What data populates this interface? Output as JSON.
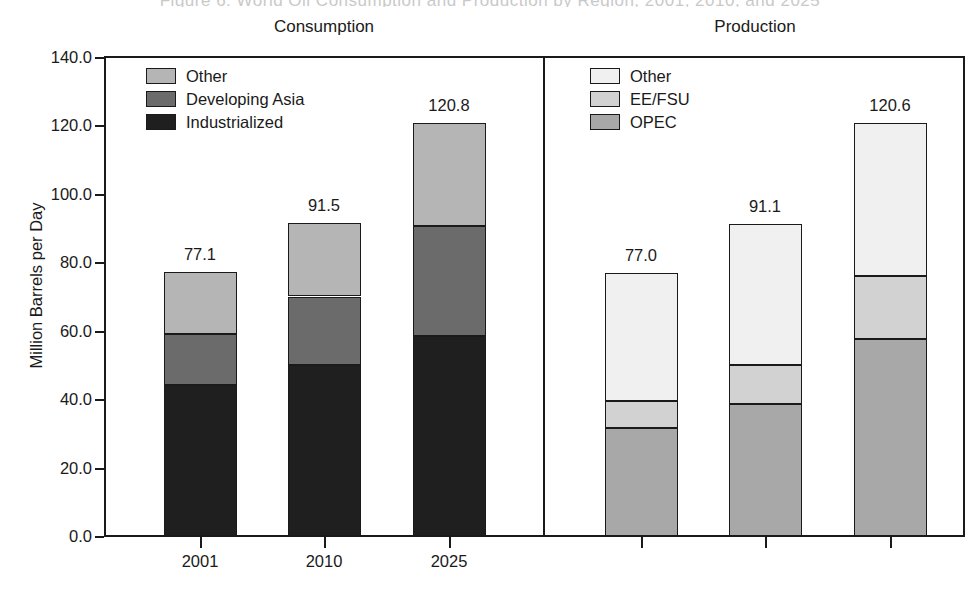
{
  "figure": {
    "ghost_title": "Figure 6.  World Oil Consumption and Production by Region, 2001, 2010, and 2025",
    "y_axis_label": "Million Barrels per Day",
    "y_ticks": [
      "0.0",
      "20.0",
      "40.0",
      "60.0",
      "80.0",
      "100.0",
      "120.0",
      "140.0"
    ],
    "x_ticks": [
      "2001",
      "2010",
      "2025"
    ]
  },
  "panels": {
    "consumption": {
      "title": "Consumption",
      "legend": [
        {
          "label": "Other",
          "color": "#b5b5b5"
        },
        {
          "label": "Developing Asia",
          "color": "#6b6b6b"
        },
        {
          "label": "Industrialized",
          "color": "#1f1f1f"
        }
      ],
      "totals": [
        "77.1",
        "91.5",
        "120.8"
      ]
    },
    "production": {
      "title": "Production",
      "legend": [
        {
          "label": "Other",
          "color": "#f0f0f0"
        },
        {
          "label": "EE/FSU",
          "color": "#d2d2d2"
        },
        {
          "label": "OPEC",
          "color": "#a8a8a8"
        }
      ],
      "totals": [
        "77.0",
        "91.1",
        "120.6"
      ]
    }
  },
  "chart_data": {
    "type": "bar",
    "subtype": "stacked",
    "title": "World Oil Consumption and Production by Region",
    "xlabel": "",
    "ylabel": "Million Barrels per Day",
    "ylim": [
      0.0,
      140.0
    ],
    "ytick_step": 20.0,
    "grid": false,
    "legend_position": "inside-top-left",
    "panels": [
      {
        "name": "Consumption",
        "categories": [
          "2001",
          "2010",
          "2025"
        ],
        "stack_order_bottom_to_top": [
          "Industrialized",
          "Developing Asia",
          "Other"
        ],
        "series": [
          {
            "name": "Industrialized",
            "values": [
              44.0,
              50.0,
              58.5
            ],
            "color": "#1f1f1f"
          },
          {
            "name": "Developing Asia",
            "values": [
              15.0,
              20.0,
              32.0
            ],
            "color": "#6b6b6b"
          },
          {
            "name": "Other",
            "values": [
              18.1,
              21.5,
              30.3
            ],
            "color": "#b5b5b5"
          }
        ],
        "totals": [
          77.1,
          91.5,
          120.8
        ],
        "data_labels": [
          "77.1",
          "91.5",
          "120.8"
        ]
      },
      {
        "name": "Production",
        "categories": [
          "2001",
          "2010",
          "2025"
        ],
        "stack_order_bottom_to_top": [
          "OPEC",
          "EE/FSU",
          "Other"
        ],
        "series": [
          {
            "name": "OPEC",
            "values": [
              31.5,
              38.7,
              57.5
            ],
            "color": "#a8a8a8"
          },
          {
            "name": "EE/FSU",
            "values": [
              8.0,
              11.3,
              18.5
            ],
            "color": "#d2d2d2"
          },
          {
            "name": "Other",
            "values": [
              37.5,
              41.1,
              44.6
            ],
            "color": "#f0f0f0"
          }
        ],
        "totals": [
          77.0,
          91.1,
          120.6
        ],
        "data_labels": [
          "77.0",
          "91.1",
          "120.6"
        ]
      }
    ]
  }
}
